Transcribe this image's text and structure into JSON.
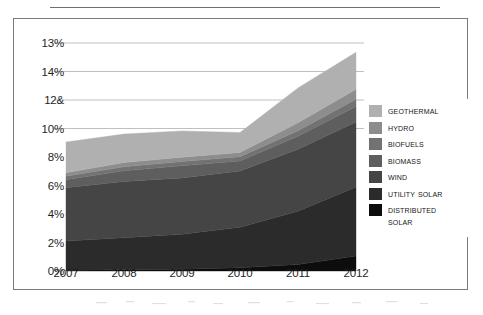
{
  "figure": {
    "frame_border_color": "#7a7a7a",
    "background": "#ffffff",
    "rule_color": "#6f6f6f"
  },
  "chart_data": {
    "type": "area",
    "stacked": true,
    "title": "",
    "subtitle": "",
    "xlabel": "",
    "ylabel": "",
    "x": [
      2007,
      2008,
      2009,
      2010,
      2011,
      2012
    ],
    "categories": [
      "2007",
      "2008",
      "2009",
      "2010",
      "2011",
      "2012"
    ],
    "xtick_labels": [
      "2007",
      "2008",
      "2009",
      "2010",
      "2011",
      "2012"
    ],
    "ytick_labels": [
      "13%",
      "14%",
      "12&",
      "10%",
      "8%",
      "6%",
      "4%",
      "2%",
      "0%"
    ],
    "ytick_values": [
      16,
      14,
      12,
      10,
      8,
      6,
      4,
      2,
      0
    ],
    "ylim": [
      0,
      16
    ],
    "grid": "horizontal",
    "gridlines_at": [
      16,
      14,
      12,
      10
    ],
    "grid_color": "#b9b9b9",
    "legend_position": "right",
    "series": [
      {
        "name": "Distributed Solar",
        "legend_label": "Distributed\nSolar",
        "color": "#0d0d0d",
        "values": [
          0.05,
          0.08,
          0.13,
          0.22,
          0.45,
          1.05
        ]
      },
      {
        "name": "Utility Solar",
        "legend_label": "Utility Solar",
        "color": "#2b2b2b",
        "values": [
          2.05,
          2.25,
          2.45,
          2.85,
          3.75,
          4.85
        ]
      },
      {
        "name": "Wind",
        "legend_label": "Wind",
        "color": "#454545",
        "values": [
          3.75,
          3.95,
          3.95,
          3.95,
          4.35,
          4.55
        ]
      },
      {
        "name": "Biomass",
        "legend_label": "Biomass",
        "color": "#5e5e5e",
        "values": [
          0.55,
          0.75,
          0.85,
          0.7,
          0.9,
          1.1
        ]
      },
      {
        "name": "Biofuels",
        "legend_label": "Biofuels",
        "color": "#727272",
        "values": [
          0.25,
          0.28,
          0.3,
          0.3,
          0.4,
          0.5
        ]
      },
      {
        "name": "Hydro",
        "legend_label": "Hydro",
        "color": "#8d8d8d",
        "values": [
          0.25,
          0.3,
          0.3,
          0.3,
          0.55,
          0.7
        ]
      },
      {
        "name": "Geothermal",
        "legend_label": "Geothermal",
        "color": "#b0b0b0",
        "values": [
          2.15,
          2.0,
          1.85,
          1.4,
          2.45,
          2.6
        ]
      }
    ],
    "totals": [
      9.05,
      9.61,
      9.83,
      9.72,
      12.85,
      15.35
    ]
  },
  "legend": {
    "items": [
      {
        "label": "Geothermal",
        "color": "#b0b0b0"
      },
      {
        "label": "Hydro",
        "color": "#8d8d8d"
      },
      {
        "label": "Biofuels",
        "color": "#727272"
      },
      {
        "label": "Biomass",
        "color": "#5e5e5e"
      },
      {
        "label": "Wind",
        "color": "#454545"
      },
      {
        "label": "Utility Solar",
        "color": "#2b2b2b"
      },
      {
        "label": "Distributed\nSolar",
        "color": "#0d0d0d"
      }
    ]
  }
}
